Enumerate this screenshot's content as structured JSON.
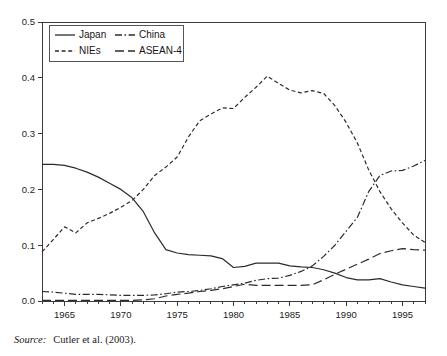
{
  "figure": {
    "source_label": "Source:",
    "source_text": "Cutler et al. (2003)."
  },
  "legend": {
    "entries": [
      {
        "label": "Japan",
        "style": "solid",
        "name": "legend-japan"
      },
      {
        "label": "China",
        "style": "dashdot",
        "name": "legend-china"
      },
      {
        "label": "NIEs",
        "style": "shortdash",
        "name": "legend-nies"
      },
      {
        "label": "ASEAN-4",
        "style": "longdash",
        "name": "legend-asean4"
      }
    ]
  },
  "chart_data": {
    "type": "line",
    "title": "",
    "xlabel": "",
    "ylabel": "",
    "xlim": [
      1963,
      1997
    ],
    "ylim": [
      0.0,
      0.5
    ],
    "grid": false,
    "legend_position": "top-left",
    "xticks": [
      1965,
      1970,
      1975,
      1980,
      1985,
      1990,
      1995
    ],
    "xtick_labels": [
      "1965",
      "1970",
      "1975",
      "1980",
      "1985",
      "1990",
      "1995"
    ],
    "yticks": [
      0.0,
      0.1,
      0.2,
      0.3,
      0.4,
      0.5
    ],
    "ytick_labels": [
      "0.0",
      "0.1",
      "0.2",
      "0.3",
      "0.4",
      "0.5"
    ],
    "x": [
      1963,
      1964,
      1965,
      1966,
      1967,
      1968,
      1969,
      1970,
      1971,
      1972,
      1973,
      1974,
      1975,
      1976,
      1977,
      1978,
      1979,
      1980,
      1981,
      1982,
      1983,
      1984,
      1985,
      1986,
      1987,
      1988,
      1989,
      1990,
      1991,
      1992,
      1993,
      1994,
      1995,
      1996,
      1997
    ],
    "series": [
      {
        "name": "Japan",
        "style": "solid",
        "values": [
          0.245,
          0.245,
          0.243,
          0.238,
          0.231,
          0.222,
          0.211,
          0.2,
          0.185,
          0.16,
          0.122,
          0.092,
          0.086,
          0.083,
          0.082,
          0.081,
          0.076,
          0.06,
          0.062,
          0.068,
          0.068,
          0.068,
          0.063,
          0.061,
          0.06,
          0.056,
          0.05,
          0.042,
          0.038,
          0.038,
          0.04,
          0.034,
          0.029,
          0.026,
          0.023
        ]
      },
      {
        "name": "China",
        "style": "dashdot",
        "values": [
          0.017,
          0.016,
          0.014,
          0.012,
          0.012,
          0.012,
          0.011,
          0.01,
          0.01,
          0.01,
          0.011,
          0.013,
          0.016,
          0.017,
          0.019,
          0.022,
          0.026,
          0.029,
          0.032,
          0.037,
          0.04,
          0.041,
          0.046,
          0.053,
          0.063,
          0.08,
          0.1,
          0.125,
          0.15,
          0.196,
          0.225,
          0.233,
          0.234,
          0.242,
          0.252
        ]
      },
      {
        "name": "NIEs",
        "style": "shortdash",
        "values": [
          0.088,
          0.11,
          0.133,
          0.122,
          0.14,
          0.148,
          0.157,
          0.168,
          0.18,
          0.2,
          0.225,
          0.24,
          0.258,
          0.294,
          0.323,
          0.335,
          0.346,
          0.345,
          0.365,
          0.383,
          0.403,
          0.39,
          0.378,
          0.373,
          0.377,
          0.372,
          0.35,
          0.32,
          0.283,
          0.235,
          0.196,
          0.165,
          0.14,
          0.118,
          0.105
        ]
      },
      {
        "name": "ASEAN-4",
        "style": "longdash",
        "values": [
          0.001,
          0.001,
          0.001,
          0.001,
          0.001,
          0.001,
          0.001,
          0.001,
          0.001,
          0.002,
          0.004,
          0.009,
          0.012,
          0.014,
          0.017,
          0.019,
          0.022,
          0.026,
          0.03,
          0.028,
          0.028,
          0.028,
          0.028,
          0.028,
          0.029,
          0.038,
          0.048,
          0.057,
          0.066,
          0.075,
          0.085,
          0.09,
          0.094,
          0.092,
          0.091
        ]
      }
    ]
  }
}
